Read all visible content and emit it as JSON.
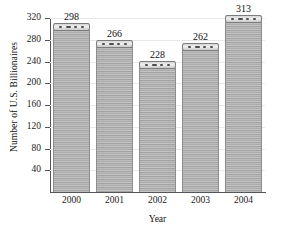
{
  "chart_data": {
    "type": "bar",
    "title": "",
    "xlabel": "Year",
    "ylabel": "Number of U.S. Billionaires",
    "categories": [
      "2000",
      "2001",
      "2002",
      "2003",
      "2004"
    ],
    "values": [
      298,
      266,
      228,
      262,
      313
    ],
    "ylim": [
      0,
      320
    ],
    "ytick_values": [
      40,
      80,
      120,
      160,
      200,
      240,
      280,
      320
    ],
    "ytick_labels": [
      "40",
      "80",
      "120",
      "160",
      "200",
      "240",
      "280",
      "320"
    ],
    "value_labels": [
      "298",
      "266",
      "228",
      "262",
      "313"
    ],
    "grid": true,
    "legend": null,
    "bar_color": "#b0b0b0",
    "bar_edge_color": "#8e8e8e",
    "axis_color": "#55565a",
    "grid_color": "#e9e9ea",
    "text_color": "#1b1b1b"
  }
}
